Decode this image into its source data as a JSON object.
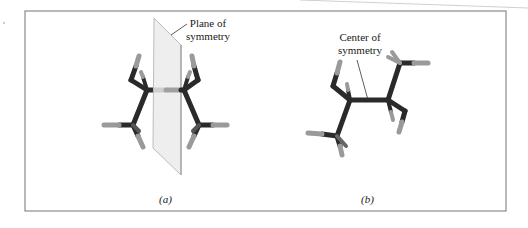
{
  "figure": {
    "panel_a": {
      "caption": "(a)",
      "annotation_line1": "Plane of",
      "annotation_line2": "symmetry"
    },
    "panel_b": {
      "caption": "(b)",
      "annotation_line1": "Center of",
      "annotation_line2": "symmetry"
    },
    "colors": {
      "frame": "#8a8a8a",
      "carbon_bond": "#2a2a2a",
      "hydrogen_bond": "#9a9a9a",
      "plane_fill": "#ebebeb",
      "plane_edge": "#bdbdbd"
    }
  }
}
